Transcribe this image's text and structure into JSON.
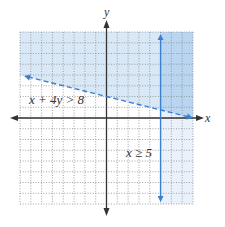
{
  "chart_data": {
    "type": "line",
    "title": "",
    "xlabel": "x",
    "ylabel": "y",
    "xlim": [
      -8,
      8
    ],
    "ylim": [
      -8,
      8
    ],
    "grid": true,
    "grid_style": "dotted",
    "series": [
      {
        "name": "x + 4y > 8",
        "equation": "x + 4y = 8",
        "style": "dashed",
        "points": [
          [
            -8,
            4
          ],
          [
            8,
            0
          ]
        ],
        "shade": "above"
      },
      {
        "name": "x ≥ 5",
        "equation": "x = 5",
        "style": "solid",
        "points": [
          [
            5,
            8
          ],
          [
            5,
            -8
          ]
        ],
        "shade": "right"
      }
    ],
    "annotations": [
      {
        "text": "x + 4y > 8",
        "x": -7.4,
        "y": 1.6
      },
      {
        "text": "x ≥ 5",
        "x": 1.9,
        "y": -3.2
      }
    ]
  },
  "labels": {
    "x_axis": "x",
    "y_axis": "y",
    "ineq1": "x + 4y > 8",
    "ineq2": "x ≥ 5"
  },
  "colors": {
    "line": "#3a7fd0",
    "shade_both": "#b9d5f0",
    "shade_line_only": "#d9e8f7",
    "shade_vertical_only": "#e9f2fb",
    "grid": "#8a8a8a",
    "axis": "#333333"
  }
}
